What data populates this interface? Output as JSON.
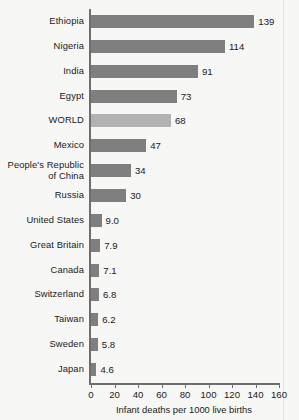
{
  "chart_data": {
    "type": "bar",
    "orientation": "horizontal",
    "title": "",
    "xlabel": "Infant deaths per 1000 live births",
    "ylabel": "",
    "xlim": [
      0,
      160
    ],
    "xticks": [
      0,
      20,
      40,
      60,
      80,
      100,
      120,
      140,
      160
    ],
    "xtick_labels": [
      "0",
      "20",
      "40",
      "60",
      "80",
      "100",
      "120",
      "140",
      "160"
    ],
    "grid": false,
    "legend": null,
    "categories": [
      "Ethiopia",
      "Nigeria",
      "India",
      "Egypt",
      "WORLD",
      "Mexico",
      "People's Republic\nof China",
      "Russia",
      "United States",
      "Great Britain",
      "Canada",
      "Switzerland",
      "Taiwan",
      "Sweden",
      "Japan"
    ],
    "values": [
      139,
      114,
      91,
      73,
      68,
      47,
      34,
      30,
      9.0,
      7.9,
      7.1,
      6.8,
      6.2,
      5.8,
      4.6
    ],
    "value_labels": [
      "139",
      "114",
      "91",
      "73",
      "68",
      "47",
      "34",
      "30",
      "9.0",
      "7.9",
      "7.1",
      "6.8",
      "6.2",
      "5.8",
      "4.6"
    ],
    "highlight_category": "WORLD",
    "colors": {
      "bar": "#7f7f7f",
      "bar_highlight": "#b2b2b2",
      "axis": "#6e6e6e",
      "text": "#1b1b1b",
      "background": "#f7f7f5"
    }
  }
}
